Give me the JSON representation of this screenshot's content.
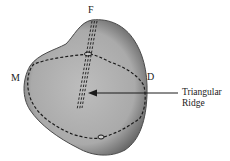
{
  "figure": {
    "labels": {
      "top": "F",
      "left": "M",
      "right": "D"
    },
    "callout": {
      "line1": "Triangular",
      "line2": "Ridge"
    },
    "colors": {
      "tooth_fill": "#a9a9a9",
      "tooth_edge": "#4a4a4a",
      "dash": "#1a1a1a",
      "text": "#222222"
    }
  }
}
